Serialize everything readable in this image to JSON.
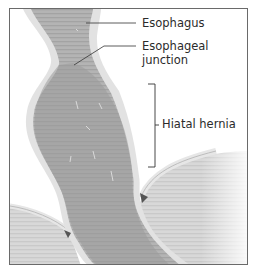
{
  "figure": {
    "labels": {
      "esophagus": "Esophagus",
      "junction_line1": "Esophageal",
      "junction_line2": "junction",
      "hernia": "Hiatal hernia"
    },
    "colors": {
      "frame": "#6a6a6a",
      "tissue_dark": "#9a9a9a",
      "tissue_light": "#c8c8c8",
      "wall": "#e4e4e4",
      "leader": "#333333"
    }
  }
}
